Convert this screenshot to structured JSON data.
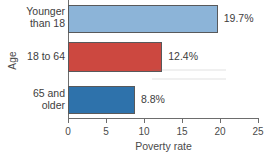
{
  "chart_data": {
    "type": "bar",
    "orientation": "horizontal",
    "title": "",
    "xlabel": "Poverty rate",
    "ylabel": "Age",
    "categories": [
      "Younger than 18",
      "18 to 64",
      "65 and older"
    ],
    "values": [
      19.7,
      12.4,
      8.8
    ],
    "value_labels": [
      "19.7%",
      "12.4%",
      "8.8%"
    ],
    "xlim": [
      0,
      25
    ],
    "xticks": [
      0,
      5,
      10,
      15,
      20,
      25
    ],
    "xtick_labels": [
      "0",
      "5",
      "10",
      "15",
      "20",
      "25"
    ],
    "grid": false,
    "legend": false,
    "bar_colors": [
      "#8cb4d8",
      "#cc4840",
      "#2e72ab"
    ],
    "bar_outline_color": "#58595b",
    "axis_color": "#6d6d6d"
  },
  "axes": {
    "y_title": "Age",
    "x_title": "Poverty rate"
  },
  "category_labels": [
    {
      "line1": "Younger",
      "line2": "than 18"
    },
    {
      "line1": "18 to 64",
      "line2": ""
    },
    {
      "line1": "65 and",
      "line2": "older"
    }
  ]
}
